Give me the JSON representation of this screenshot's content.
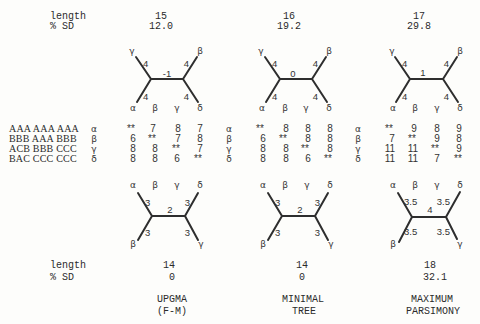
{
  "header": {
    "length_label": "length",
    "sd_label": "% SD"
  },
  "top_trees": [
    {
      "length": "15",
      "sd": "12.0",
      "internal": "-1",
      "branches": {
        "ul": "4",
        "ur": "4",
        "ll": "4",
        "lr": "4"
      },
      "upper_leaves": [
        "γ",
        "β"
      ],
      "bottom_row": [
        "α",
        "β",
        "γ",
        "δ"
      ]
    },
    {
      "length": "16",
      "sd": "19.2",
      "internal": "0",
      "branches": {
        "ul": "4",
        "ur": "4",
        "ll": "4",
        "lr": "4"
      },
      "upper_leaves": [
        "γ",
        "β"
      ],
      "bottom_row": [
        "α",
        "β",
        "γ",
        "δ"
      ]
    },
    {
      "length": "17",
      "sd": "29.8",
      "internal": "1",
      "branches": {
        "ul": "4",
        "ur": "4",
        "ll": "4",
        "lr": "4"
      },
      "upper_leaves": [
        "γ",
        "β"
      ],
      "bottom_row": [
        "α",
        "β",
        "γ",
        "δ"
      ]
    }
  ],
  "matrix": {
    "sequences": [
      "AAA AAA AAA",
      "BBB AAA BBB",
      "ACB BBB CCC",
      "BAC CCC CCC"
    ],
    "row_labels": [
      "α",
      "β",
      "γ",
      "δ"
    ],
    "blocks": [
      [
        [
          "**",
          "7",
          "8",
          "7"
        ],
        [
          "6",
          "**",
          "7",
          "8"
        ],
        [
          "8",
          "8",
          "**",
          "7"
        ],
        [
          "8",
          "8",
          "6",
          "**"
        ]
      ],
      [
        [
          "**",
          "8",
          "8",
          "8"
        ],
        [
          "6",
          "**",
          "8",
          "8"
        ],
        [
          "8",
          "8",
          "**",
          "8"
        ],
        [
          "8",
          "8",
          "6",
          "**"
        ]
      ],
      [
        [
          "**",
          "9",
          "8",
          "9"
        ],
        [
          "7",
          "**",
          "9",
          "8"
        ],
        [
          "11",
          "11",
          "**",
          "9"
        ],
        [
          "11",
          "11",
          "7",
          "**"
        ]
      ]
    ]
  },
  "bottom_trees": [
    {
      "internal": "2",
      "branches": {
        "ul": "3",
        "ur": "3",
        "ll": "3",
        "lr": "3"
      },
      "top_row": [
        "α",
        "β",
        "γ",
        "δ"
      ],
      "lower_leaves": [
        "β",
        "γ"
      ]
    },
    {
      "internal": "2",
      "branches": {
        "ul": "3",
        "ur": "3",
        "ll": "3",
        "lr": "3"
      },
      "top_row": [
        "α",
        "β",
        "γ",
        "δ"
      ],
      "lower_leaves": [
        "β",
        "γ"
      ]
    },
    {
      "internal": "4",
      "branches": {
        "ul": "3.5",
        "ur": "3.5",
        "ll": "3.5",
        "lr": "3.5"
      },
      "top_row": [
        "α",
        "β",
        "γ",
        "δ"
      ],
      "lower_leaves": [
        "β",
        "γ"
      ]
    }
  ],
  "footer": {
    "length_label": "length",
    "sd_label": "% SD",
    "values": [
      {
        "length": "14",
        "sd": "0"
      },
      {
        "length": "14",
        "sd": "0"
      },
      {
        "length": "18",
        "sd": "32.1"
      }
    ]
  },
  "methods": [
    {
      "line1": "UPGMA",
      "line2": "(F-M)"
    },
    {
      "line1": "MINIMAL",
      "line2": "TREE"
    },
    {
      "line1": "MAXIMUM",
      "line2": "PARSIMONY"
    }
  ]
}
